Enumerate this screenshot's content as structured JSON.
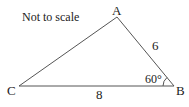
{
  "diagram": {
    "note": "Not to scale",
    "colors": {
      "stroke": "#555555",
      "text": "#222222",
      "background": "#ffffff"
    },
    "vertices": {
      "A": {
        "label": "A",
        "x": 117,
        "y": 17
      },
      "B": {
        "label": "B",
        "x": 174,
        "y": 86
      },
      "C": {
        "label": "C",
        "x": 19,
        "y": 86
      }
    },
    "sides": {
      "AB": {
        "label": "6"
      },
      "CB": {
        "label": "8"
      },
      "AC": {
        "label": ""
      }
    },
    "angles": {
      "B": {
        "label": "60°"
      }
    }
  }
}
